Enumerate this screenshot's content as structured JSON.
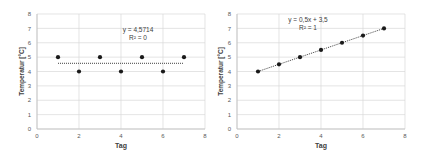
{
  "chart_data": [
    {
      "type": "scatter",
      "title": "",
      "xlabel": "Tag",
      "ylabel": "Temperatur [°C]",
      "xlim": [
        0,
        8
      ],
      "ylim": [
        0,
        8
      ],
      "xticks": [
        0,
        2,
        4,
        6,
        8
      ],
      "yticks": [
        0,
        1,
        2,
        3,
        4,
        5,
        6,
        7,
        8
      ],
      "grid": true,
      "legend": null,
      "series": [
        {
          "name": "Temperatur",
          "x": [
            1,
            2,
            3,
            4,
            5,
            6,
            7
          ],
          "y": [
            5,
            4,
            5,
            4,
            5,
            4,
            5
          ],
          "marker": "circle",
          "color": "#1a1a1a"
        }
      ],
      "trendline": {
        "type": "linear",
        "slope": 0,
        "intercept": 4.5714,
        "x_range": [
          1,
          7
        ],
        "style": "dotted",
        "equation_label": "y = 4,5714",
        "r2_label": "R² = 0"
      }
    },
    {
      "type": "scatter",
      "title": "",
      "xlabel": "Tag",
      "ylabel": "Temperatur [°C]",
      "xlim": [
        0,
        8
      ],
      "ylim": [
        0,
        8
      ],
      "xticks": [
        0,
        2,
        4,
        6,
        8
      ],
      "yticks": [
        0,
        1,
        2,
        3,
        4,
        5,
        6,
        7,
        8
      ],
      "grid": true,
      "legend": null,
      "series": [
        {
          "name": "Temperatur",
          "x": [
            1,
            2,
            3,
            4,
            5,
            6,
            7
          ],
          "y": [
            4,
            4.5,
            5,
            5.5,
            6,
            6.5,
            7
          ],
          "marker": "circle",
          "color": "#1a1a1a"
        }
      ],
      "trendline": {
        "type": "linear",
        "slope": 0.5,
        "intercept": 3.5,
        "x_range": [
          1,
          7
        ],
        "style": "dotted",
        "equation_label": "y = 0,5x + 3,5",
        "r2_label": "R² = 1"
      }
    }
  ],
  "style": {
    "grid_color": "#d9d9d9",
    "axis_color": "#bfbfbf",
    "tick_label_color": "#595959",
    "axis_title_color": "#404040",
    "marker_color": "#1a1a1a",
    "trendline_color": "#404040"
  }
}
